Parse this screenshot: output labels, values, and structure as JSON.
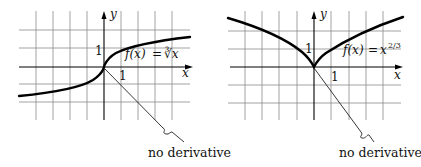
{
  "figures": [
    {
      "id": "cube-root",
      "function_label": "f(x) = ∛x",
      "function_label_parts": {
        "lhs": "f(x)",
        "eq": "=",
        "rhs": "∛x"
      },
      "x_axis_label": "x",
      "y_axis_label": "y",
      "x_tick_label": "1",
      "y_tick_label": "1",
      "annotation": "no derivative"
    },
    {
      "id": "two-thirds-power",
      "function_label": "f(x) = x^(2/3)",
      "function_label_parts": {
        "lhs": "f(x)",
        "eq": "=",
        "base": "x",
        "exponent": "2/3"
      },
      "x_axis_label": "x",
      "y_axis_label": "y",
      "x_tick_label": "1",
      "y_tick_label": "1",
      "annotation": "no derivative"
    }
  ]
}
